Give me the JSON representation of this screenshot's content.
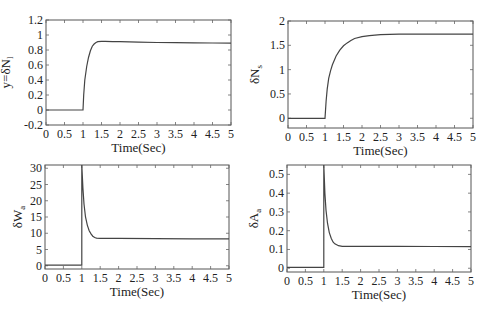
{
  "figure": {
    "width": 482,
    "height": 318,
    "line_color": "#444444",
    "frame_color": "#555555"
  },
  "chart_data": [
    {
      "id": "top-left",
      "type": "line",
      "title": "",
      "xlabel": "Time(Sec)",
      "ylabel": "y=δN_l",
      "ylabel_main": "y=δN",
      "ylabel_sub": "l",
      "xlim": [
        0,
        5
      ],
      "ylim": [
        -0.2,
        1.2
      ],
      "xticks": [
        0,
        0.5,
        1,
        1.5,
        2,
        2.5,
        3,
        3.5,
        4,
        4.5,
        5
      ],
      "xtick_labels": [
        "0",
        "0.5",
        "1",
        "1.5",
        "2",
        "2.5",
        "3",
        "3.5",
        "4",
        "4.5",
        "5"
      ],
      "yticks": [
        -0.2,
        0,
        0.2,
        0.4,
        0.6,
        0.8,
        1,
        1.2
      ],
      "ytick_labels": [
        "-0.2",
        "0",
        "0.2",
        "0.4",
        "0.6",
        "0.8",
        "1",
        "1.2"
      ],
      "grid": false,
      "box": [
        46,
        20,
        231,
        125
      ],
      "series": [
        {
          "name": "response",
          "x": [
            0,
            1,
            1.02,
            1.05,
            1.1,
            1.15,
            1.2,
            1.25,
            1.3,
            1.35,
            1.4,
            1.5,
            1.6,
            1.8,
            2.0,
            2.5,
            3.0,
            3.5,
            4.0,
            4.5,
            5.0
          ],
          "y": [
            0,
            0,
            0.2,
            0.4,
            0.58,
            0.7,
            0.79,
            0.85,
            0.88,
            0.9,
            0.91,
            0.915,
            0.915,
            0.912,
            0.91,
            0.905,
            0.9,
            0.897,
            0.895,
            0.893,
            0.892
          ]
        }
      ]
    },
    {
      "id": "top-right",
      "type": "line",
      "title": "",
      "xlabel": "Time(Sec)",
      "ylabel": "δN_s",
      "ylabel_main": "δN",
      "ylabel_sub": "s",
      "xlim": [
        0,
        5
      ],
      "ylim": [
        -0.2,
        2
      ],
      "xticks": [
        0,
        0.5,
        1,
        1.5,
        2,
        2.5,
        3,
        3.5,
        4,
        4.5,
        5
      ],
      "xtick_labels": [
        "0",
        "0.5",
        "1",
        "1.5",
        "2",
        "2.5",
        "3",
        "3.5",
        "4",
        "4.5",
        "5"
      ],
      "yticks": [
        0,
        0.5,
        1,
        1.5,
        2
      ],
      "ytick_labels": [
        "0",
        "0.5",
        "1",
        "1.5",
        "2"
      ],
      "grid": false,
      "box": [
        288,
        21,
        473,
        128
      ],
      "series": [
        {
          "name": "response",
          "x": [
            0,
            1,
            1.03,
            1.06,
            1.1,
            1.15,
            1.2,
            1.3,
            1.4,
            1.5,
            1.6,
            1.7,
            1.8,
            2.0,
            2.2,
            2.5,
            3.0,
            3.5,
            4.0,
            4.5,
            5.0
          ],
          "y": [
            0,
            0,
            0.35,
            0.6,
            0.82,
            0.98,
            1.1,
            1.28,
            1.4,
            1.49,
            1.55,
            1.6,
            1.64,
            1.68,
            1.7,
            1.72,
            1.73,
            1.73,
            1.73,
            1.73,
            1.73
          ]
        }
      ]
    },
    {
      "id": "bottom-left",
      "type": "line",
      "title": "",
      "xlabel": "Time(Sec)",
      "ylabel": "δW_a",
      "ylabel_main": "δW",
      "ylabel_sub": "a",
      "xlim": [
        0,
        5
      ],
      "ylim": [
        -1,
        31
      ],
      "xticks": [
        0,
        0.5,
        1,
        1.5,
        2,
        2.5,
        3,
        3.5,
        4,
        4.5,
        5
      ],
      "xtick_labels": [
        "0",
        "0.5",
        "1",
        "1.5",
        "2",
        "2.5",
        "3",
        "3.5",
        "4",
        "4.5",
        "5"
      ],
      "yticks": [
        0,
        5,
        10,
        15,
        20,
        25,
        30
      ],
      "ytick_labels": [
        "0",
        "5",
        "10",
        "15",
        "20",
        "25",
        "30"
      ],
      "grid": false,
      "box": [
        45,
        165,
        229,
        269
      ],
      "series": [
        {
          "name": "response",
          "x": [
            0,
            1,
            1,
            1.03,
            1.06,
            1.1,
            1.15,
            1.2,
            1.25,
            1.3,
            1.35,
            1.4,
            1.5,
            1.7,
            2.0,
            3.0,
            4.0,
            5.0
          ],
          "y": [
            0.2,
            0.2,
            31,
            24,
            19,
            15,
            12.5,
            10.8,
            9.8,
            9.1,
            8.7,
            8.5,
            8.4,
            8.4,
            8.4,
            8.35,
            8.3,
            8.3
          ]
        }
      ]
    },
    {
      "id": "bottom-right",
      "type": "line",
      "title": "",
      "xlabel": "Time(Sec)",
      "ylabel": "δA_a",
      "ylabel_main": "δA",
      "ylabel_sub": "a",
      "xlim": [
        0,
        5
      ],
      "ylim": [
        -0.02,
        0.55
      ],
      "xticks": [
        0,
        0.5,
        1,
        1.5,
        2,
        2.5,
        3,
        3.5,
        4,
        4.5,
        5
      ],
      "xtick_labels": [
        "0",
        "0.5",
        "1",
        "1.5",
        "2",
        "2.5",
        "3",
        "3.5",
        "4",
        "4.5",
        "5"
      ],
      "yticks": [
        0,
        0.1,
        0.2,
        0.3,
        0.4,
        0.5
      ],
      "ytick_labels": [
        "0",
        "0.1",
        "0.2",
        "0.3",
        "0.4",
        "0.5"
      ],
      "grid": false,
      "box": [
        287,
        165,
        471,
        272
      ],
      "series": [
        {
          "name": "response",
          "x": [
            0,
            1,
            1,
            1.03,
            1.06,
            1.1,
            1.15,
            1.2,
            1.25,
            1.3,
            1.35,
            1.4,
            1.5,
            1.7,
            2.0,
            3.0,
            4.0,
            5.0
          ],
          "y": [
            0.005,
            0.005,
            0.55,
            0.4,
            0.31,
            0.24,
            0.19,
            0.16,
            0.14,
            0.13,
            0.125,
            0.12,
            0.117,
            0.117,
            0.117,
            0.117,
            0.116,
            0.115
          ]
        }
      ]
    }
  ]
}
